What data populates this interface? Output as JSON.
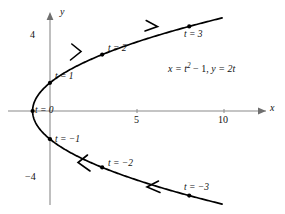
{
  "figure": {
    "type": "parametric-curve-plot",
    "background_color": "#ffffff",
    "curve_color": "#000000",
    "axis_color": "#8a8a8a"
  },
  "axes": {
    "x_axis_label": "x",
    "y_axis_label": "y",
    "x_ticks": [
      {
        "label": "5",
        "value": 5
      },
      {
        "label": "10",
        "value": 10
      }
    ],
    "y_ticks": [
      {
        "label": "4",
        "value": 4
      },
      {
        "label": "−4",
        "value": -4
      }
    ],
    "x_range": [
      -2,
      11.6
    ],
    "y_range": [
      -6.6,
      6.6
    ]
  },
  "equation": {
    "x_part_lead": "x = ",
    "x_part_var": "t",
    "x_part_exp": "2",
    "x_part_tail": " − 1, ",
    "y_part_lead": "y = 2",
    "y_part_var": "t",
    "full_text": "x = t² − 1, y = 2t"
  },
  "point_labels": [
    {
      "label": "t = 3",
      "t": 3,
      "x": 8,
      "y": 6
    },
    {
      "label": "t = 2",
      "t": 2,
      "x": 3,
      "y": 4
    },
    {
      "label": "t = 1",
      "t": 1,
      "x": 0,
      "y": 2
    },
    {
      "label": "t = 0",
      "t": 0,
      "x": -1,
      "y": 0
    },
    {
      "label": "t = −1",
      "t": -1,
      "x": 0,
      "y": -2
    },
    {
      "label": "t = −2",
      "t": -2,
      "x": 3,
      "y": -4
    },
    {
      "label": "t = −3",
      "t": -3,
      "x": 8,
      "y": -6
    }
  ],
  "chart_data": {
    "type": "line",
    "title": "",
    "xlabel": "x",
    "ylabel": "y",
    "parametric": true,
    "equations": {
      "x": "t^2 - 1",
      "y": "2t"
    },
    "t_range": [
      -3.3,
      3.3
    ],
    "marked_points": [
      {
        "t": -3,
        "x": 8,
        "y": -6
      },
      {
        "t": -2,
        "x": 3,
        "y": -4
      },
      {
        "t": -1,
        "x": 0,
        "y": -2
      },
      {
        "t": 0,
        "x": -1,
        "y": 0
      },
      {
        "t": 1,
        "x": 0,
        "y": 2
      },
      {
        "t": 2,
        "x": 3,
        "y": 4
      },
      {
        "t": 3,
        "x": 8,
        "y": 6
      }
    ],
    "direction_arrows": [
      {
        "t": 1.5,
        "direction": "increasing-t"
      },
      {
        "t": 2.5,
        "direction": "increasing-t"
      },
      {
        "t": -1.5,
        "direction": "increasing-t"
      },
      {
        "t": -2.5,
        "direction": "increasing-t"
      }
    ],
    "xlim": [
      -2,
      11.6
    ],
    "ylim": [
      -6.6,
      6.6
    ],
    "grid": false,
    "legend": false
  }
}
